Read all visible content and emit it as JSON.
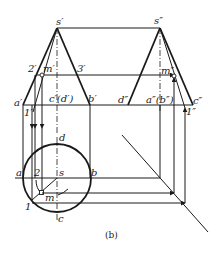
{
  "figure": {
    "caption": "(b)",
    "front_view": {
      "apex": "s′",
      "left_base": "a′",
      "right_base": "b′",
      "center_base": "c′(d′)",
      "point_on_left_edge": "2′",
      "point_on_right_edge": "3′",
      "point_m": "m′",
      "point_1": "1′"
    },
    "side_view": {
      "apex": "s″",
      "left_base": "d″",
      "right_base": "c″",
      "center_base": "a″(b″)",
      "point_m": "m″",
      "point_1": "1″"
    },
    "top_view": {
      "center": "s",
      "left": "a",
      "right": "b",
      "top": "d",
      "bottom": "c",
      "point_2": "2",
      "point_m": "m",
      "point_1": "1"
    }
  }
}
